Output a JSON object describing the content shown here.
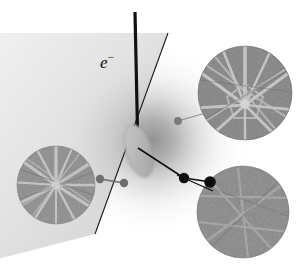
{
  "figure": {
    "domain": "diagram",
    "kind": "ebsd-schematic",
    "background_color": "#ffffff",
    "width": 300,
    "height": 267
  },
  "labels": {
    "beam_label_text": "e",
    "beam_label_superscript": "−",
    "beam_label_full": "e⁻",
    "beam_label_x": 100,
    "beam_label_y": 54
  },
  "beam": {
    "name": "incident-electron-beam",
    "color": "#111111",
    "width": 3.2,
    "x1": 135,
    "y1": 12,
    "x2": 137,
    "y2": 128
  },
  "sample_surface": {
    "name": "tilted-sample-surface",
    "edge_color": "#1a1a1a",
    "edge_width": 1.1,
    "edge_x1": 168,
    "edge_y1": 33,
    "edge_x2": 95,
    "edge_y2": 234,
    "fill_light": "#d8d8d8",
    "fill_dark": "#9a9a9a"
  },
  "interaction_volume": {
    "name": "interaction-volume-ellipse",
    "fill": "#b9b9b9",
    "stroke": "#8f8f8f",
    "cx": 139,
    "cy": 150,
    "rx": 13,
    "ry": 27,
    "rotation_deg": -16
  },
  "glow": {
    "name": "backscatter-glow",
    "cx": 150,
    "cy": 140,
    "r": 95,
    "inner_color": "#8c8c8c",
    "outer_color": "#ffffff"
  },
  "patterns": [
    {
      "id": "pattern-left",
      "name": "kikuchi-pattern-left",
      "cx": 56,
      "cy": 185,
      "r": 39,
      "base_color": "#8d8d8d",
      "band_color": "#d6d6d6",
      "band_count": 13,
      "description": "Kikuchi diffraction pattern, dense radial band star"
    },
    {
      "id": "pattern-top-right",
      "name": "kikuchi-pattern-top-right",
      "cx": 245,
      "cy": 93,
      "r": 47,
      "base_color": "#858585",
      "band_color": "#cfcfcf",
      "band_count": 11,
      "description": "Kikuchi diffraction pattern, bright star with polygon zone axis"
    },
    {
      "id": "pattern-bottom-right",
      "name": "kikuchi-pattern-bottom-right",
      "cx": 243,
      "cy": 212,
      "r": 46,
      "base_color": "#8a8a8a",
      "band_color": "#b6b6b6",
      "band_count": 6,
      "description": "Kikuchi diffraction pattern, faint diffuse bands"
    }
  ],
  "markers": [
    {
      "id": "marker-surface-left",
      "name": "sample-point-marker-left",
      "cx": 100,
      "cy": 179,
      "r": 4.2,
      "color": "#6e6e6e"
    },
    {
      "id": "marker-surface-left-outer",
      "name": "pattern-anchor-marker-left",
      "cx": 124,
      "cy": 183,
      "r": 4.2,
      "color": "#6e6e6e"
    },
    {
      "id": "marker-top-right",
      "name": "pattern-anchor-marker-top-right",
      "cx": 178,
      "cy": 121,
      "r": 4.0,
      "color": "#7b7b7b"
    },
    {
      "id": "marker-detector-a",
      "name": "detector-node-marker-a",
      "cx": 184,
      "cy": 178,
      "r": 5.2,
      "color": "#0d0d0d"
    },
    {
      "id": "marker-detector-b",
      "name": "detector-node-marker-b",
      "cx": 209,
      "cy": 182,
      "r": 5.8,
      "color": "#0d0d0d"
    }
  ],
  "leader_lines": [
    {
      "id": "leader-left",
      "name": "leader-line-left-pattern",
      "x1": 100,
      "y1": 179,
      "x2": 124,
      "y2": 183,
      "color": "#6e6e6e",
      "width": 1.6
    },
    {
      "id": "leader-top-right",
      "name": "leader-line-top-right-pattern",
      "x1": 178,
      "y1": 121,
      "x2": 208,
      "y2": 112,
      "color": "#8a8a8a",
      "width": 1.0
    },
    {
      "id": "scatter-path-main",
      "name": "backscatter-ray-main",
      "x1": 138,
      "y1": 148,
      "x2": 184,
      "y2": 178,
      "color": "#0d0d0d",
      "width": 1.5
    },
    {
      "id": "scatter-path-upper",
      "name": "backscatter-ray-upper",
      "x1": 184,
      "y1": 178,
      "x2": 209,
      "y2": 182,
      "color": "#0d0d0d",
      "width": 1.5
    },
    {
      "id": "scatter-path-lower",
      "name": "backscatter-ray-lower",
      "x1": 178,
      "y1": 176,
      "x2": 212,
      "y2": 190,
      "color": "#0d0d0d",
      "width": 1.2
    }
  ]
}
